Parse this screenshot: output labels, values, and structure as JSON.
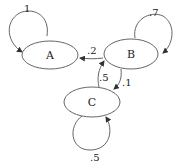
{
  "diagram": {
    "type": "markov-chain",
    "nodes": [
      {
        "id": "A",
        "label": "A"
      },
      {
        "id": "B",
        "label": "B"
      },
      {
        "id": "C",
        "label": "C"
      }
    ],
    "edges": [
      {
        "from": "A",
        "to": "A",
        "label": "1"
      },
      {
        "from": "B",
        "to": "B",
        "label": ".7"
      },
      {
        "from": "B",
        "to": "A",
        "label": ".2"
      },
      {
        "from": "B",
        "to": "C",
        "label": ".1"
      },
      {
        "from": "C",
        "to": "B",
        "label": ".5"
      },
      {
        "from": "C",
        "to": "C",
        "label": ".5"
      }
    ]
  }
}
